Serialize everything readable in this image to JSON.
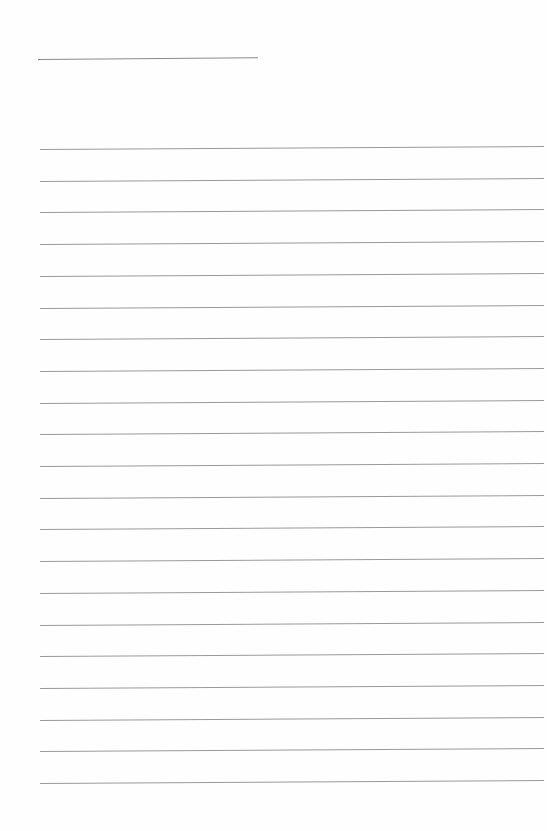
{
  "document": {
    "type": "lined-paper",
    "title_text": "",
    "title_line": {
      "x": 38,
      "y": 59,
      "width": 220
    },
    "ruled_lines": {
      "count": 21,
      "start_y": 149,
      "spacing": 31.7,
      "left": 40,
      "width": 504
    },
    "colors": {
      "paper": "#fefefe",
      "line": "#9a9a9a"
    }
  }
}
